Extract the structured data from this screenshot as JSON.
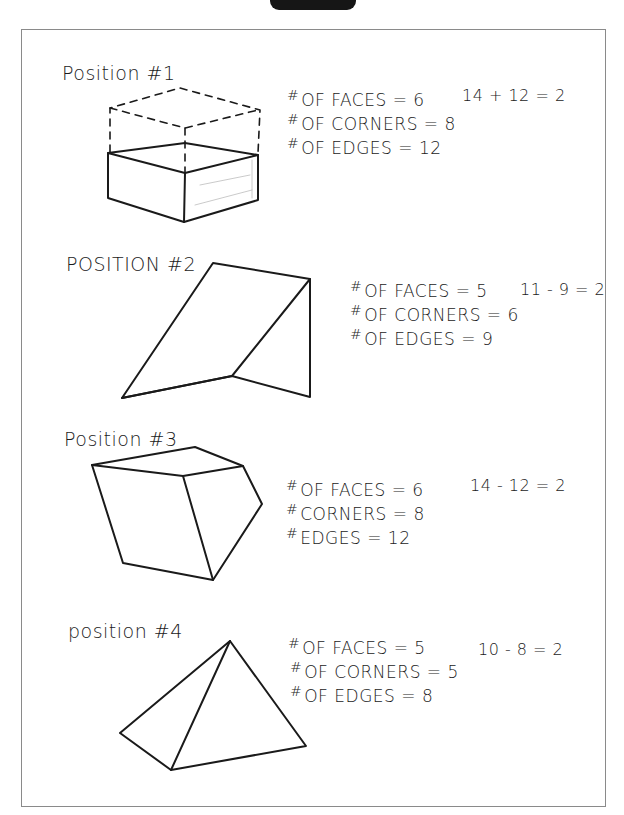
{
  "positions": [
    {
      "label": "Position #1",
      "stats": [
        {
          "hash": "#",
          "text": "OF FACES = 6"
        },
        {
          "hash": "#",
          "text": "OF CORNERS = 8"
        },
        {
          "hash": "#",
          "text": "OF EDGES = 12"
        }
      ],
      "calc": "14 + 12 = 2",
      "shape": "rectangular-prism"
    },
    {
      "label": "POSITION #2",
      "stats": [
        {
          "hash": "#",
          "text": "OF FACES = 5"
        },
        {
          "hash": "#",
          "text": "OF CORNERS = 6"
        },
        {
          "hash": "#",
          "text": "OF EDGES = 9"
        }
      ],
      "calc": "11 - 9 = 2",
      "shape": "triangular-prism"
    },
    {
      "label": "Position #3",
      "stats": [
        {
          "hash": "#",
          "text": "OF FACES = 6"
        },
        {
          "hash": "#",
          "text": "CORNERS = 8"
        },
        {
          "hash": "#",
          "text": "EDGES = 12"
        }
      ],
      "calc": "14 - 12 = 2",
      "shape": "tilted-cube"
    },
    {
      "label": "position #4",
      "stats": [
        {
          "hash": "#",
          "text": "OF FACES = 5"
        },
        {
          "hash": "#",
          "text": "OF CORNERS = 5"
        },
        {
          "hash": "#",
          "text": "OF EDGES = 8"
        }
      ],
      "calc": "10 - 8 = 2",
      "shape": "pyramid"
    }
  ]
}
